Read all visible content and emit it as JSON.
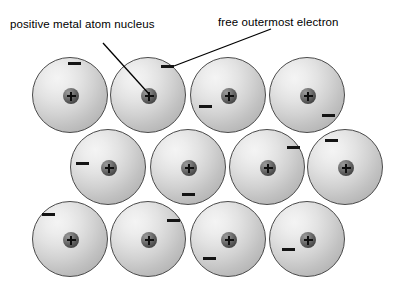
{
  "diagram": {
    "background_color": "#ffffff",
    "sphere_fill_light": "#f4f4f4",
    "sphere_fill_dark": "#a8a8a8",
    "sphere_border_color": "#4a4a4a",
    "nucleus_color": "#434343",
    "electron_color": "#141414",
    "leader_line_color": "#000000"
  },
  "labels": {
    "nucleus": "positive metal atom nucleus",
    "electron": "free outermost electron"
  },
  "leader_lines": [
    {
      "name": "nucleus-leader",
      "x1": 103,
      "y1": 43,
      "x2": 149,
      "y2": 94
    },
    {
      "name": "electron-leader",
      "x1": 271,
      "y1": 29,
      "x2": 174,
      "y2": 66
    }
  ],
  "atoms": [
    {
      "row": 1,
      "col": 1,
      "cx": 70,
      "cy": 95,
      "charge": "+",
      "electrons": [
        {
          "x": 68,
          "y": 62
        }
      ]
    },
    {
      "row": 1,
      "col": 2,
      "cx": 148,
      "cy": 95,
      "charge": "+",
      "electrons": [
        {
          "x": 161,
          "y": 65
        }
      ]
    },
    {
      "row": 1,
      "col": 3,
      "cx": 228,
      "cy": 95,
      "charge": "+",
      "electrons": [
        {
          "x": 199,
          "y": 105
        }
      ]
    },
    {
      "row": 1,
      "col": 4,
      "cx": 307,
      "cy": 95,
      "charge": "+",
      "electrons": [
        {
          "x": 322,
          "y": 114
        }
      ]
    },
    {
      "row": 2,
      "col": 1,
      "cx": 108,
      "cy": 167,
      "charge": "+",
      "electrons": [
        {
          "x": 76,
          "y": 162
        }
      ]
    },
    {
      "row": 2,
      "col": 2,
      "cx": 188,
      "cy": 167,
      "charge": "+",
      "electrons": [
        {
          "x": 182,
          "y": 193
        }
      ]
    },
    {
      "row": 2,
      "col": 3,
      "cx": 267,
      "cy": 167,
      "charge": "+",
      "electrons": [
        {
          "x": 287,
          "y": 146
        }
      ]
    },
    {
      "row": 2,
      "col": 4,
      "cx": 345,
      "cy": 167,
      "charge": "+",
      "electrons": [
        {
          "x": 325,
          "y": 139
        }
      ]
    },
    {
      "row": 3,
      "col": 1,
      "cx": 70,
      "cy": 239,
      "charge": "+",
      "electrons": [
        {
          "x": 42,
          "y": 213
        }
      ]
    },
    {
      "row": 3,
      "col": 2,
      "cx": 148,
      "cy": 239,
      "charge": "+",
      "electrons": [
        {
          "x": 167,
          "y": 219
        }
      ]
    },
    {
      "row": 3,
      "col": 3,
      "cx": 228,
      "cy": 239,
      "charge": "+",
      "electrons": [
        {
          "x": 203,
          "y": 257
        }
      ]
    },
    {
      "row": 3,
      "col": 4,
      "cx": 307,
      "cy": 239,
      "charge": "+",
      "electrons": [
        {
          "x": 282,
          "y": 248
        }
      ]
    }
  ],
  "draw_order": [
    8,
    9,
    10,
    11,
    4,
    5,
    6,
    7,
    0,
    1,
    2,
    3
  ]
}
